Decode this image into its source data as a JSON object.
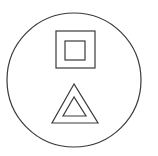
{
  "symbol": {
    "description": "Class II double-insulation symbol above a warning double triangle, inside a circle",
    "stroke_color": "#3a3a3a",
    "background": "#ffffff",
    "circle": {
      "cx": 74,
      "cy": 80,
      "r": 67
    },
    "outer_square": {
      "x": 56,
      "y": 31,
      "w": 39,
      "h": 37
    },
    "inner_square": {
      "x": 65,
      "y": 41,
      "w": 20,
      "h": 19
    },
    "outer_triangle": "74,84 52,123 98,123",
    "inner_triangle": "74,97 63,116 86,116"
  }
}
